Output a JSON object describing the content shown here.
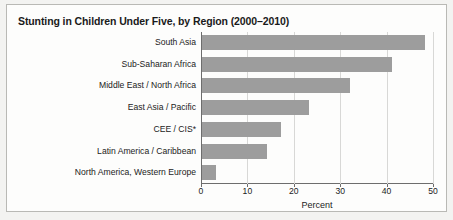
{
  "figure": {
    "title": "Stunting in Children Under Five, by Region (2000–2010)"
  },
  "chart_data": {
    "type": "bar",
    "orientation": "horizontal",
    "title": "Stunting in Children Under Five, by Region (2000–2010)",
    "xlabel": "Percent",
    "ylabel": "",
    "xlim": [
      0,
      50
    ],
    "xticks": [
      0,
      10,
      20,
      30,
      40,
      50
    ],
    "xtick_labels": [
      "0",
      "10",
      "20",
      "30",
      "40",
      "50"
    ],
    "grid": "vertical",
    "legend": "none",
    "bar_color": "#9d9d9d",
    "categories": [
      "South Asia",
      "Sub-Saharan Africa",
      "Middle East / North Africa",
      "East Asia / Pacific",
      "CEE / CIS*",
      "Latin America / Caribbean",
      "North America, Western Europe"
    ],
    "values": [
      48,
      41,
      32,
      23,
      17,
      14,
      3
    ]
  }
}
